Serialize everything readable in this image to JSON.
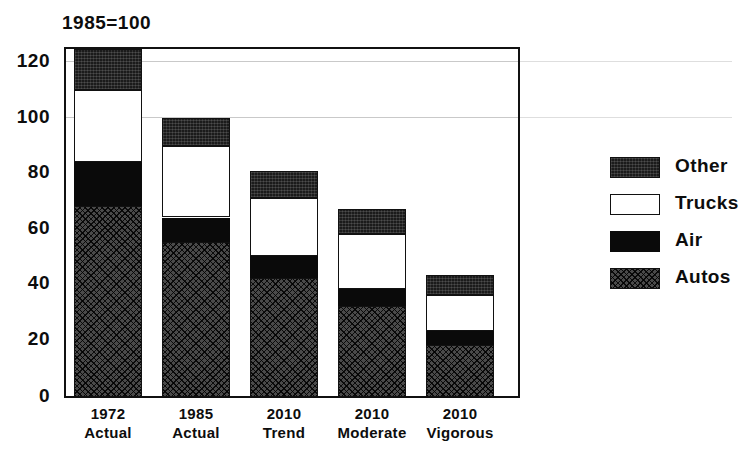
{
  "chart_data": {
    "type": "bar",
    "subtype": "stacked-bar",
    "title": "1985=100",
    "xlabel": "",
    "ylabel": "",
    "ylim": [
      0,
      126
    ],
    "yticks": [
      0,
      20,
      40,
      60,
      80,
      100,
      120
    ],
    "ytick_labels": [
      "0",
      "20",
      "40",
      "60",
      "80",
      "100",
      "120"
    ],
    "grid": true,
    "legend_position": "right",
    "categories": [
      "1972 Actual",
      "1985 Actual",
      "2010 Trend",
      "2010 Moderate",
      "2010 Vigorous"
    ],
    "category_lines": [
      {
        "line1": "1972",
        "line2": "Actual"
      },
      {
        "line1": "1985",
        "line2": "Actual"
      },
      {
        "line1": "2010",
        "line2": "Trend"
      },
      {
        "line1": "2010",
        "line2": "Moderate"
      },
      {
        "line1": "2010",
        "line2": "Vigorous"
      }
    ],
    "stack_order_bottom_to_top": [
      "Autos",
      "Air",
      "Trucks",
      "Other"
    ],
    "series": [
      {
        "name": "Autos",
        "key": "autos",
        "pattern": "crosshatch",
        "values": [
          69,
          56,
          43,
          33,
          19
        ]
      },
      {
        "name": "Air",
        "key": "air",
        "pattern": "solid-black",
        "values": [
          16,
          9,
          8,
          6,
          5
        ]
      },
      {
        "name": "Trucks",
        "key": "trucks",
        "pattern": "open-white",
        "values": [
          26,
          26,
          21,
          20,
          13
        ]
      },
      {
        "name": "Other",
        "key": "other",
        "pattern": "dark-stipple",
        "values": [
          15,
          10,
          10,
          9,
          7
        ]
      }
    ],
    "totals": [
      126,
      101,
      82,
      68,
      44
    ],
    "cumulative_tops": [
      {
        "autos": 69,
        "air": 85,
        "trucks": 111,
        "other": 126
      },
      {
        "autos": 56,
        "air": 65,
        "trucks": 91,
        "other": 101
      },
      {
        "autos": 43,
        "air": 51,
        "trucks": 72,
        "other": 82
      },
      {
        "autos": 33,
        "air": 39,
        "trucks": 59,
        "other": 68
      },
      {
        "autos": 19,
        "air": 24,
        "trucks": 37,
        "other": 44
      }
    ],
    "legend": [
      {
        "label": "Other",
        "key": "other"
      },
      {
        "label": "Trucks",
        "key": "trucks"
      },
      {
        "label": "Air",
        "key": "air"
      },
      {
        "label": "Autos",
        "key": "autos"
      }
    ],
    "colors": {
      "autos": "#4a4a4a",
      "air": "#0a0a0a",
      "trucks": "#ffffff",
      "other": "#1b1b1b",
      "axis": "#111111",
      "grid": "#c9c9c9",
      "background": "#ffffff",
      "text": "#0d0d0d"
    }
  }
}
